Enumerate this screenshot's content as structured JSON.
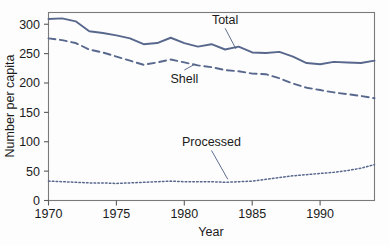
{
  "chart_data": {
    "type": "line",
    "title": "",
    "xlabel": "Year",
    "ylabel": "Number per capita",
    "xlim": [
      1970,
      1994
    ],
    "ylim": [
      0,
      320
    ],
    "xticks": [
      1970,
      1975,
      1980,
      1985,
      1990
    ],
    "yticks": [
      0,
      50,
      100,
      150,
      200,
      250,
      300
    ],
    "grid": false,
    "legend_position": "inline-annotations",
    "x": [
      1970,
      1971,
      1972,
      1973,
      1974,
      1975,
      1976,
      1977,
      1978,
      1979,
      1980,
      1981,
      1982,
      1983,
      1984,
      1985,
      1986,
      1987,
      1988,
      1989,
      1990,
      1991,
      1992,
      1993,
      1994
    ],
    "series": [
      {
        "name": "Total",
        "style": "solid",
        "color": "#58688d",
        "values": [
          309,
          310,
          305,
          288,
          285,
          281,
          276,
          266,
          268,
          277,
          268,
          262,
          266,
          257,
          262,
          252,
          251,
          253,
          245,
          234,
          232,
          236,
          235,
          234,
          238
        ]
      },
      {
        "name": "Shell",
        "style": "dashed",
        "color": "#58688d",
        "values": [
          276,
          273,
          268,
          257,
          252,
          245,
          238,
          231,
          235,
          240,
          235,
          230,
          227,
          222,
          220,
          216,
          215,
          208,
          199,
          192,
          188,
          184,
          181,
          178,
          174
        ]
      },
      {
        "name": "Processed",
        "style": "dotted",
        "color": "#58688d",
        "values": [
          33,
          32,
          31,
          30,
          30,
          29,
          30,
          31,
          32,
          33,
          32,
          32,
          32,
          31,
          32,
          33,
          36,
          39,
          42,
          44,
          46,
          48,
          51,
          55,
          61
        ]
      }
    ],
    "annotations": [
      {
        "text": "Total",
        "x": 1983,
        "y": 300,
        "leader_to_x": 1983.8,
        "leader_to_y": 258
      },
      {
        "text": "Shell",
        "x": 1980,
        "y": 200,
        "leader_to_x": 1980.7,
        "leader_to_y": 231
      },
      {
        "text": "Processed",
        "x": 1982,
        "y": 92,
        "leader_to_x": 1983.2,
        "leader_to_y": 36
      }
    ]
  },
  "axes": {
    "y_tick_labels": [
      "300",
      "250",
      "200",
      "150",
      "100",
      "50",
      "0"
    ],
    "x_tick_labels": [
      "1970",
      "1975",
      "1980",
      "1985",
      "1990"
    ],
    "x_title": "Year",
    "y_title": "Number per capita"
  },
  "labels": {
    "total": "Total",
    "shell": "Shell",
    "processed": "Processed"
  },
  "colors": {
    "line": "#58688d",
    "axis": "#7a7a7a",
    "text": "#1b1b1b",
    "background": "#fdfdfd"
  }
}
